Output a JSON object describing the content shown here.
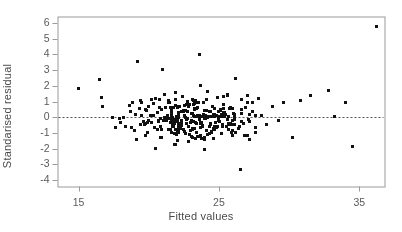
{
  "chart_data": {
    "type": "scatter",
    "title": "",
    "xlabel": "Fitted values",
    "ylabel": "Standarised residual",
    "xlim": [
      13.5,
      36.8
    ],
    "ylim": [
      -4.4,
      6.4
    ],
    "xticks": [
      15,
      25,
      35
    ],
    "xtick_labels": [
      "15",
      "25",
      "35"
    ],
    "yticks": [
      -4,
      -3,
      -2,
      -1,
      0,
      1,
      2,
      3,
      4,
      5,
      6
    ],
    "ytick_labels": [
      "-4",
      "-3",
      "-2",
      "-1",
      "0",
      "1",
      "2",
      "3",
      "4",
      "5",
      "6"
    ],
    "grid": false,
    "legend": "none",
    "reference_line": {
      "type": "horizontal",
      "y": 0,
      "style": "dashed",
      "color": "#555555"
    },
    "marker": {
      "shape": "square",
      "size": 2.6,
      "color": "#111111"
    },
    "frame_color": "#9a9a9a",
    "background": "#ffffff",
    "n_points": 318,
    "points": [
      [
        15.0,
        1.85
      ],
      [
        16.5,
        2.38
      ],
      [
        16.6,
        1.28
      ],
      [
        16.7,
        0.7
      ],
      [
        17.4,
        -0.03
      ],
      [
        17.9,
        -0.08
      ],
      [
        17.6,
        -0.62
      ],
      [
        18.0,
        -0.3
      ],
      [
        18.2,
        0.02
      ],
      [
        18.3,
        -0.55
      ],
      [
        18.6,
        0.75
      ],
      [
        18.8,
        0.95
      ],
      [
        18.7,
        0.35
      ],
      [
        19.0,
        -0.85
      ],
      [
        19.1,
        -1.4
      ],
      [
        19.2,
        3.55
      ],
      [
        19.3,
        0.55
      ],
      [
        19.4,
        1.05
      ],
      [
        19.5,
        0.15
      ],
      [
        19.6,
        -0.25
      ],
      [
        19.7,
        -0.48
      ],
      [
        19.8,
        0.42
      ],
      [
        19.9,
        -0.95
      ],
      [
        20.0,
        0.72
      ],
      [
        20.1,
        0.1
      ],
      [
        20.2,
        -0.35
      ],
      [
        20.3,
        0.88
      ],
      [
        20.4,
        -0.62
      ],
      [
        20.5,
        1.22
      ],
      [
        20.6,
        0.32
      ],
      [
        20.7,
        -0.18
      ],
      [
        20.8,
        -1.25
      ],
      [
        20.9,
        0.52
      ],
      [
        21.0,
        3.05
      ],
      [
        21.1,
        1.48
      ],
      [
        21.2,
        0.62
      ],
      [
        21.3,
        -0.05
      ],
      [
        21.4,
        -0.78
      ],
      [
        21.5,
        0.92
      ],
      [
        21.6,
        0.22
      ],
      [
        21.7,
        -0.42
      ],
      [
        21.8,
        -1.05
      ],
      [
        21.9,
        1.15
      ],
      [
        22.0,
        0.05
      ],
      [
        22.1,
        -0.58
      ],
      [
        22.2,
        0.68
      ],
      [
        22.3,
        -0.22
      ],
      [
        22.4,
        1.35
      ],
      [
        22.5,
        -0.9
      ],
      [
        22.6,
        0.45
      ],
      [
        22.7,
        -0.12
      ],
      [
        22.8,
        -1.55
      ],
      [
        22.9,
        0.82
      ],
      [
        23.0,
        0.25
      ],
      [
        23.1,
        -0.68
      ],
      [
        23.2,
        1.05
      ],
      [
        23.3,
        -0.32
      ],
      [
        23.4,
        0.58
      ],
      [
        23.5,
        -1.18
      ],
      [
        23.6,
        0.15
      ],
      [
        23.7,
        2.05
      ],
      [
        23.8,
        -0.52
      ],
      [
        23.9,
        0.95
      ],
      [
        24.0,
        -0.08
      ],
      [
        24.1,
        -0.82
      ],
      [
        24.2,
        1.62
      ],
      [
        24.3,
        0.38
      ],
      [
        24.4,
        -0.45
      ],
      [
        24.5,
        0.72
      ],
      [
        24.6,
        -1.35
      ],
      [
        24.7,
        0.18
      ],
      [
        24.8,
        -0.65
      ],
      [
        24.9,
        1.25
      ],
      [
        25.0,
        -0.28
      ],
      [
        25.1,
        0.48
      ],
      [
        25.2,
        -1.02
      ],
      [
        25.3,
        0.85
      ],
      [
        25.4,
        0.08
      ],
      [
        25.5,
        -0.55
      ],
      [
        25.6,
        1.45
      ],
      [
        25.7,
        -0.38
      ],
      [
        25.8,
        0.62
      ],
      [
        25.9,
        -0.95
      ],
      [
        26.0,
        0.28
      ],
      [
        26.2,
        2.48
      ],
      [
        26.4,
        -0.72
      ],
      [
        26.6,
        0.52
      ],
      [
        26.8,
        -1.15
      ],
      [
        27.0,
        0.95
      ],
      [
        27.2,
        -0.25
      ],
      [
        27.4,
        0.35
      ],
      [
        27.6,
        -0.62
      ],
      [
        27.8,
        1.18
      ],
      [
        28.0,
        0.12
      ],
      [
        28.4,
        -0.45
      ],
      [
        28.8,
        0.68
      ],
      [
        29.2,
        -0.18
      ],
      [
        29.6,
        0.95
      ],
      [
        30.2,
        -1.25
      ],
      [
        30.8,
        1.05
      ],
      [
        31.5,
        1.38
      ],
      [
        32.8,
        1.72
      ],
      [
        34.0,
        0.95
      ],
      [
        33.2,
        0.05
      ],
      [
        34.5,
        -1.85
      ],
      [
        26.5,
        -3.3
      ],
      [
        23.6,
        4.0
      ],
      [
        36.2,
        5.75
      ]
    ]
  },
  "axis": {
    "xlabel": "Fitted values",
    "ylabel": "Standarised residual"
  }
}
